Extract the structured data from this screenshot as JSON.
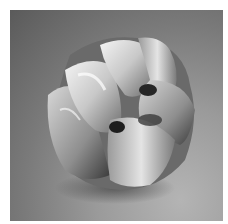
{
  "image": {
    "subject": "sculptural silver bangle with wavy folded lobes",
    "background": "gray studio gradient",
    "colors": {
      "border": "#ffffff",
      "bg_dark": "#5a5a5a",
      "bg_light": "#b4b4b4",
      "metal_highlight": "#f2f2f2",
      "metal_mid": "#a8a8a8",
      "metal_shadow": "#1e1e1e"
    }
  }
}
